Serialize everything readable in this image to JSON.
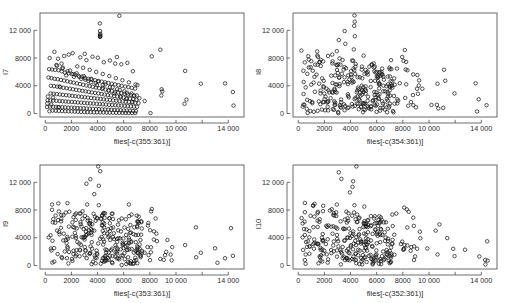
{
  "figure": {
    "title": "",
    "background_color": "#ffffff",
    "point_color": "#1a1a1a",
    "axis_color": "#4a4a4a",
    "layout": "2x2 scatterplot grid"
  },
  "chart_data": [
    {
      "type": "scatter",
      "panel": "top-left",
      "title": "",
      "xlabel": "flies[-c(355:361)]",
      "ylabel": "I7",
      "xlim": [
        -400,
        15200
      ],
      "ylim": [
        -500,
        14500
      ],
      "xticks": [
        0,
        2000,
        4000,
        6000,
        8000,
        10000,
        12000,
        14000
      ],
      "xticklabels": [
        "0",
        "2000",
        "4000",
        "6000",
        "8000",
        "10 000",
        "",
        "14 000"
      ],
      "yticks": [
        0,
        4000,
        8000,
        12000
      ],
      "yticklabels": [
        "0",
        "4000",
        "8000",
        "12 000"
      ],
      "grid": false,
      "legend": "none",
      "marker": "open-circle",
      "x": [
        5670,
        4180,
        4190,
        4205,
        4195,
        4200,
        4210,
        4185,
        8800,
        5480,
        3020,
        1800,
        700,
        340,
        980,
        1450,
        2100,
        2680,
        3150,
        3610,
        4020,
        4480,
        4950,
        5350,
        5820,
        6280,
        6700,
        7050,
        300,
        520,
        760,
        1010,
        1260,
        1510,
        1780,
        2030,
        2290,
        2540,
        2800,
        3050,
        3300,
        3560,
        3810,
        4070,
        4320,
        4580,
        4830,
        5090,
        5340,
        5600,
        5850,
        6110,
        6360,
        6620,
        6870,
        250,
        480,
        720,
        960,
        1200,
        1440,
        1690,
        1930,
        2170,
        2420,
        2660,
        2900,
        3150,
        3390,
        3630,
        3880,
        4120,
        4360,
        4610,
        4850,
        5090,
        5340,
        5580,
        5820,
        6070,
        6310,
        6550,
        6800,
        200,
        430,
        670,
        910,
        1150,
        1390,
        1630,
        1880,
        2120,
        2360,
        2600,
        2840,
        3090,
        3330,
        3570,
        3810,
        4060,
        4300,
        4540,
        4780,
        5030,
        5270,
        5510,
        5760,
        6000,
        6240,
        6480,
        6730,
        6970,
        180,
        410,
        640,
        880,
        1120,
        1350,
        1590,
        1830,
        2070,
        2310,
        2550,
        2790,
        3030,
        3270,
        3510,
        3750,
        3990,
        4230,
        4470,
        4710,
        4950,
        5190,
        5430,
        5680,
        5920,
        6160,
        6400,
        6640,
        6890,
        7130,
        160,
        390,
        620,
        850,
        1090,
        1320,
        1560,
        1790,
        2030,
        2270,
        2500,
        2740,
        2980,
        3220,
        3450,
        3690,
        3930,
        4170,
        4400,
        4640,
        4880,
        5120,
        5360,
        5590,
        5830,
        6070,
        6310,
        6550,
        6780,
        7020,
        140,
        370,
        600,
        830,
        1060,
        1300,
        1530,
        1760,
        2000,
        2230,
        2470,
        2700,
        2940,
        3170,
        3410,
        3640,
        3880,
        4110,
        4350,
        4580,
        4820,
        5060,
        5290,
        5530,
        5760,
        6000,
        6240,
        6470,
        6710,
        6940,
        320,
        560,
        800,
        1040,
        1290,
        1530,
        1770,
        2010,
        2260,
        2500,
        2740,
        2990,
        3230,
        3470,
        3720,
        3960,
        4200,
        4450,
        4690,
        4930,
        5180,
        5420,
        5660,
        5910,
        6150,
        6390,
        6640,
        6880,
        8050,
        8150,
        8900,
        8950,
        8880,
        10650,
        10700,
        10800,
        11900,
        13750,
        14350,
        14400,
        1000,
        1250,
        2450,
        2900,
        3400,
        3900,
        4400,
        4900,
        5400,
        5900,
        6400,
        6900,
        1100,
        1600,
        2200,
        2750,
        3300,
        3850,
        4400,
        4950,
        5500,
        6050,
        6600,
        7000,
        600,
        900,
        1300,
        1700,
        2150,
        2600,
        3050,
        3500,
        3950,
        4400,
        4850,
        5300,
        5750,
        6200,
        6650,
        450,
        850,
        1350,
        1900,
        2400,
        2950,
        3500,
        4050,
        4600,
        5150,
        5700,
        6250,
        6800,
        7200,
        7600
      ],
      "y": [
        14100,
        13000,
        11900,
        11500,
        11350,
        11200,
        11100,
        11050,
        9200,
        8150,
        8600,
        8500,
        8900,
        8000,
        7900,
        8300,
        8700,
        8100,
        7700,
        8200,
        8050,
        7400,
        7650,
        7200,
        7100,
        7300,
        6100,
        4100,
        6400,
        6350,
        6300,
        6250,
        6100,
        5900,
        5800,
        5700,
        5600,
        5450,
        5300,
        5150,
        5000,
        4900,
        4800,
        4700,
        4600,
        4500,
        4400,
        4300,
        4200,
        4100,
        4000,
        3900,
        3800,
        3700,
        3600,
        5200,
        5100,
        5000,
        4950,
        4850,
        4750,
        4650,
        4550,
        4450,
        4350,
        4250,
        4150,
        4050,
        3950,
        3850,
        3750,
        3650,
        3550,
        3450,
        3350,
        3250,
        3150,
        3050,
        2950,
        2850,
        2750,
        2650,
        2550,
        2450,
        4000,
        3950,
        3880,
        3800,
        3720,
        3650,
        3570,
        3500,
        3420,
        3350,
        3270,
        3200,
        3120,
        3050,
        2970,
        2900,
        2820,
        2750,
        2670,
        2600,
        2520,
        2450,
        2370,
        2300,
        2220,
        2150,
        2070,
        2000,
        1920,
        2900,
        2850,
        2800,
        2750,
        2700,
        2650,
        2600,
        2550,
        2500,
        2450,
        2400,
        2350,
        2300,
        2250,
        2200,
        2150,
        2100,
        2050,
        2000,
        1950,
        1900,
        1850,
        1800,
        1750,
        1700,
        1650,
        1600,
        1550,
        1500,
        1450,
        1900,
        1870,
        1840,
        1800,
        1770,
        1740,
        1700,
        1670,
        1640,
        1600,
        1570,
        1540,
        1500,
        1470,
        1440,
        1400,
        1370,
        1340,
        1300,
        1270,
        1240,
        1200,
        1170,
        1140,
        1100,
        1070,
        1040,
        1000,
        970,
        940,
        1000,
        980,
        960,
        930,
        910,
        890,
        860,
        840,
        820,
        790,
        770,
        750,
        720,
        700,
        680,
        650,
        630,
        610,
        580,
        560,
        540,
        510,
        490,
        470,
        440,
        420,
        400,
        370,
        350,
        330,
        420,
        400,
        380,
        360,
        340,
        320,
        300,
        280,
        260,
        240,
        220,
        200,
        190,
        180,
        170,
        160,
        150,
        140,
        130,
        120,
        110,
        100,
        95,
        90,
        85,
        80,
        75,
        70,
        8250,
        3500,
        3200,
        2600,
        1400,
        6150,
        2000,
        4300,
        4350,
        3100,
        1150,
        900,
        7200,
        6800,
        6600,
        6300,
        6000,
        5700,
        5400,
        5100,
        4800,
        4500,
        4200,
        3900,
        5500,
        5300,
        5000,
        4700,
        4400,
        4100,
        3800,
        3500,
        3200,
        2900,
        2600,
        2300,
        6900,
        6500,
        6100,
        5700,
        5300,
        4900,
        4500,
        4100,
        3700,
        3300,
        2900,
        2500,
        2100,
        1700,
        1300,
        7000,
        6600,
        6200,
        5800,
        5400,
        5000,
        4600,
        4200,
        3800,
        3400,
        3000,
        2600,
        2200,
        1800,
        1400
      ]
    },
    {
      "type": "scatter",
      "panel": "top-right",
      "title": "",
      "xlabel": "flies[-c(354:361)]",
      "ylabel": "I8",
      "xlim": [
        -400,
        15200
      ],
      "ylim": [
        -500,
        14500
      ],
      "xticks": [
        0,
        2000,
        4000,
        6000,
        8000,
        10000,
        12000,
        14000
      ],
      "xticklabels": [
        "0",
        "2000",
        "4000",
        "6000",
        "8000",
        "10 000",
        "",
        "14 000"
      ],
      "yticks": [
        0,
        4000,
        8000,
        12000
      ],
      "yticklabels": [
        "0",
        "4000",
        "8000",
        "12 000"
      ],
      "grid": false,
      "legend": "none",
      "marker": "open-circle"
    },
    {
      "type": "scatter",
      "panel": "bottom-left",
      "title": "",
      "xlabel": "flies[-c(353:361)]",
      "ylabel": "I9",
      "xlim": [
        -400,
        15200
      ],
      "ylim": [
        -500,
        14500
      ],
      "xticks": [
        0,
        2000,
        4000,
        6000,
        8000,
        10000,
        12000,
        14000
      ],
      "xticklabels": [
        "0",
        "2000",
        "4000",
        "6000",
        "8000",
        "10 000",
        "",
        "14 000"
      ],
      "yticks": [
        0,
        4000,
        8000,
        12000
      ],
      "yticklabels": [
        "0",
        "4000",
        "8000",
        "12 000"
      ],
      "grid": false,
      "legend": "none",
      "marker": "open-circle"
    },
    {
      "type": "scatter",
      "panel": "bottom-right",
      "title": "",
      "xlabel": "flies[-c(352:361)]",
      "ylabel": "I10",
      "xlim": [
        -400,
        15200
      ],
      "ylim": [
        -500,
        14500
      ],
      "xticks": [
        0,
        2000,
        4000,
        6000,
        8000,
        10000,
        12000,
        14000
      ],
      "xticklabels": [
        "0",
        "2000",
        "4000",
        "6000",
        "8000",
        "10 000",
        "",
        "14 000"
      ],
      "yticks": [
        0,
        4000,
        8000,
        12000
      ],
      "yticklabels": [
        "0",
        "4000",
        "8000",
        "12 000"
      ],
      "grid": false,
      "legend": "none",
      "marker": "open-circle"
    }
  ]
}
